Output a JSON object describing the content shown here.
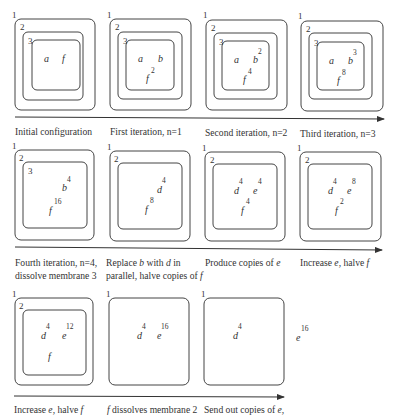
{
  "figure": {
    "rows": [
      {
        "panels": [
          {
            "id": "initial",
            "caption": "Initial configuration",
            "membranes": [
              "1",
              "2",
              "3"
            ],
            "objects": [
              {
                "symbol": "a",
                "exponent": ""
              },
              {
                "symbol": "f",
                "exponent": ""
              }
            ]
          },
          {
            "id": "iter1",
            "caption": "First iteration, n=1",
            "membranes": [
              "1",
              "2",
              "3"
            ],
            "objects": [
              {
                "symbol": "a",
                "exponent": ""
              },
              {
                "symbol": "b",
                "exponent": ""
              },
              {
                "symbol": "f",
                "exponent": "2"
              }
            ]
          },
          {
            "id": "iter2",
            "caption": "Second iteration, n=2",
            "membranes": [
              "1",
              "2",
              "3"
            ],
            "objects": [
              {
                "symbol": "a",
                "exponent": ""
              },
              {
                "symbol": "b",
                "exponent": "2"
              },
              {
                "symbol": "f",
                "exponent": "4"
              }
            ]
          },
          {
            "id": "iter3",
            "caption": "Third iteration, n=3",
            "membranes": [
              "1",
              "2",
              "3"
            ],
            "objects": [
              {
                "symbol": "a",
                "exponent": ""
              },
              {
                "symbol": "b",
                "exponent": "3"
              },
              {
                "symbol": "f",
                "exponent": "8"
              }
            ]
          }
        ]
      },
      {
        "panels": [
          {
            "id": "iter4",
            "caption_lines": [
              "Fourth iteration, n=4,",
              "dissolve membrane 3"
            ],
            "membranes": [
              "1",
              "2",
              "3"
            ],
            "objects": [
              {
                "symbol": "b",
                "exponent": "4"
              },
              {
                "symbol": "f",
                "exponent": "16"
              }
            ]
          },
          {
            "id": "replace",
            "caption_parts": {
              "line1": [
                "Replace ",
                "b",
                " with ",
                "d",
                " in"
              ],
              "line2": [
                "parallel, halve copies of ",
                "f"
              ]
            },
            "membranes": [
              "1",
              "2"
            ],
            "objects": [
              {
                "symbol": "d",
                "exponent": "4"
              },
              {
                "symbol": "f",
                "exponent": "8"
              }
            ]
          },
          {
            "id": "produce",
            "caption_parts": [
              "Produce copies of ",
              "e"
            ],
            "membranes": [
              "1",
              "2"
            ],
            "objects": [
              {
                "symbol": "d",
                "exponent": "4"
              },
              {
                "symbol": "e",
                "exponent": "4"
              },
              {
                "symbol": "f",
                "exponent": "4"
              }
            ]
          },
          {
            "id": "increase1",
            "caption_parts": [
              "Increase ",
              "e",
              ", halve ",
              "f"
            ],
            "membranes": [
              "1",
              "2"
            ],
            "objects": [
              {
                "symbol": "d",
                "exponent": "4"
              },
              {
                "symbol": "e",
                "exponent": "8"
              },
              {
                "symbol": "f",
                "exponent": "2"
              }
            ]
          }
        ]
      },
      {
        "panels": [
          {
            "id": "increase2",
            "caption_parts": [
              "Increase ",
              "e",
              ", halve ",
              "f"
            ],
            "membranes": [
              "1",
              "2"
            ],
            "objects": [
              {
                "symbol": "d",
                "exponent": "4"
              },
              {
                "symbol": "e",
                "exponent": "12"
              },
              {
                "symbol": "f",
                "exponent": ""
              }
            ]
          },
          {
            "id": "dissolve2",
            "caption_parts": [
              "f",
              " dissolves membrane 2"
            ],
            "membranes": [
              "1"
            ],
            "objects": [
              {
                "symbol": "d",
                "exponent": "4"
              },
              {
                "symbol": "e",
                "exponent": "16"
              }
            ]
          },
          {
            "id": "sendout",
            "caption_parts": [
              "Send out copies of ",
              "e",
              ","
            ],
            "membranes": [
              "1"
            ],
            "objects": [
              {
                "symbol": "d",
                "exponent": "4"
              }
            ],
            "outside_objects": [
              {
                "symbol": "e",
                "exponent": "16"
              }
            ]
          }
        ]
      }
    ]
  }
}
